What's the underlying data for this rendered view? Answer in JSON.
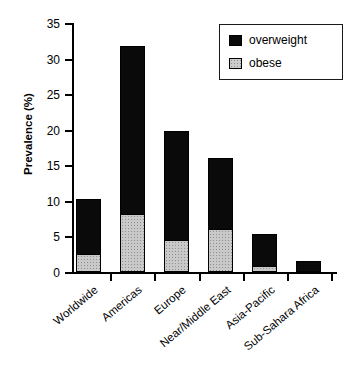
{
  "chart_data": {
    "type": "bar",
    "subtype": "stacked-vertical",
    "title": "",
    "xlabel": "",
    "ylabel": "Prevalence (%)",
    "ylim": [
      0,
      35
    ],
    "yticks": [
      0,
      5,
      10,
      15,
      20,
      25,
      30,
      35
    ],
    "ytick_labels": [
      "0",
      "5",
      "10",
      "15",
      "20",
      "25",
      "30",
      "35"
    ],
    "grid": false,
    "legend_position": "top-right",
    "categories": [
      "Worldwide",
      "Americas",
      "Europe",
      "Near/Middle East",
      "Asia-Pacific",
      "Sub-Sahara Africa"
    ],
    "series": [
      {
        "name": "obese",
        "color": "#cccccc",
        "values": [
          2.6,
          8.2,
          4.5,
          6.1,
          0.9,
          0.0
        ]
      },
      {
        "name": "overweight",
        "color": "#0a0a0a",
        "values": [
          7.7,
          23.6,
          15.3,
          9.9,
          4.5,
          1.6
        ]
      }
    ],
    "totals": [
      10.3,
      31.8,
      19.8,
      16.0,
      5.4,
      1.6
    ]
  },
  "axis": {
    "y_title": "Prevalence (%)"
  },
  "legend": {
    "entries": [
      {
        "label": "overweight",
        "swatch": "black-square-icon"
      },
      {
        "label": "obese",
        "swatch": "stippled-square-icon"
      }
    ]
  }
}
